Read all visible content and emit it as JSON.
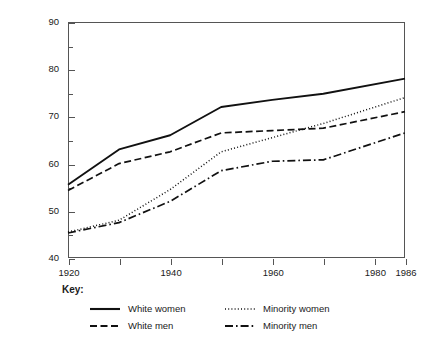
{
  "chart_data": {
    "type": "line",
    "title": "",
    "xlabel": "",
    "ylabel": "Life Expectancy (in years)",
    "xlim": [
      1920,
      1986
    ],
    "ylim": [
      40,
      90
    ],
    "grid": false,
    "legend_position": "below-plot",
    "x": [
      1920,
      1930,
      1940,
      1950,
      1960,
      1970,
      1986
    ],
    "x_tick_labels": [
      "1920",
      "1940",
      "1960",
      "1980",
      "1986"
    ],
    "x_major_ticks": [
      1920,
      1940,
      1960,
      1980,
      1986
    ],
    "x_minor_ticks": [
      1930,
      1950,
      1970
    ],
    "y_tick_labels": [
      "40",
      "50",
      "60",
      "70",
      "80",
      "90"
    ],
    "y_major_ticks": [
      40,
      50,
      60,
      70,
      80,
      90
    ],
    "y_minor_ticks": [
      45,
      55,
      65,
      75,
      85
    ],
    "series": [
      {
        "name": "White women",
        "style": "solid",
        "color": "#111111",
        "values": [
          55.5,
          63.0,
          66.0,
          72.0,
          73.5,
          74.8,
          78.0
        ]
      },
      {
        "name": "White men",
        "style": "dashed",
        "color": "#111111",
        "values": [
          54.3,
          60.0,
          62.5,
          66.5,
          67.0,
          67.5,
          71.0
        ]
      },
      {
        "name": "Minority women",
        "style": "dotted",
        "color": "#111111",
        "values": [
          45.5,
          48.0,
          54.5,
          62.5,
          65.5,
          68.5,
          74.0
        ]
      },
      {
        "name": "Minority men",
        "style": "dash-dot",
        "color": "#111111",
        "values": [
          45.3,
          47.5,
          52.0,
          58.5,
          60.5,
          60.8,
          66.5
        ]
      }
    ]
  },
  "legend": {
    "title": "Key:",
    "entries": [
      {
        "label": "White women",
        "style": "solid"
      },
      {
        "label": "Minority women",
        "style": "dotted"
      },
      {
        "label": "White men",
        "style": "dashed"
      },
      {
        "label": "Minority men",
        "style": "dash-dot"
      }
    ]
  }
}
